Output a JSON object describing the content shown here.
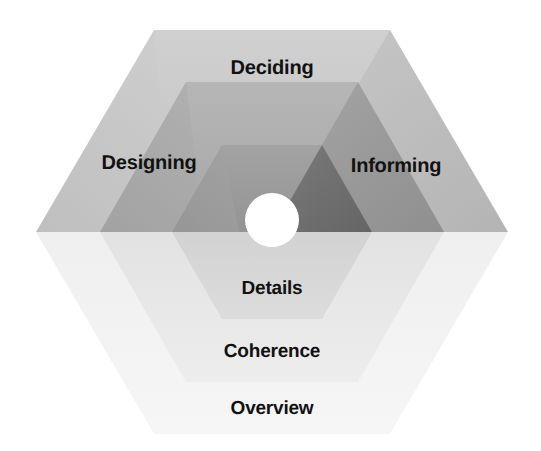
{
  "diagram": {
    "type": "nested-hexagon-rings",
    "geometry": {
      "center_x": 272,
      "center_y": 232,
      "rings": [
        {
          "name": "outer",
          "radius": 236,
          "half_height": 210
        },
        {
          "name": "middle",
          "radius": 172,
          "half_height": 150
        },
        {
          "name": "inner",
          "radius": 100,
          "half_height": 87
        }
      ],
      "hub_hole": {
        "center_x": 272,
        "center_y": 220,
        "radius": 27,
        "color": "#ffffff"
      }
    },
    "labels": {
      "deciding": "Deciding",
      "designing": "Designing",
      "informing": "Informing",
      "details": "Details",
      "coherence": "Coherence",
      "overview": "Overview"
    },
    "upper_facets": [
      {
        "ring": "outer",
        "label": "Deciding",
        "facets": {
          "left": "#c6c6c6",
          "top": "#c9c9c9",
          "right": "#bdbdbd"
        }
      },
      {
        "ring": "middle",
        "label": "Designing / Informing band",
        "facets": {
          "left": "#ababab",
          "top": "#aeaeae",
          "right": "#9a9a9a"
        }
      },
      {
        "ring": "inner",
        "label": "Inner core",
        "facets": {
          "left": "#9d9d9d",
          "top": "#9b9b9b",
          "right": "#6f6f6f"
        }
      }
    ],
    "lower_bands": [
      {
        "ring": "outer",
        "label": "Overview",
        "color": "#f2f2f2"
      },
      {
        "ring": "middle",
        "label": "Coherence",
        "color": "#e6e6e6"
      },
      {
        "ring": "inner",
        "label": "Details",
        "color": "#d6d6d6"
      }
    ],
    "palette": {
      "background": "#ffffff",
      "text": "#111111",
      "outer_upper_left": "#c6c6c6",
      "outer_upper_top": "#c9c9c9",
      "outer_upper_right": "#bdbdbd",
      "middle_upper_left": "#ababab",
      "middle_upper_top": "#aeaeae",
      "middle_upper_right": "#9a9a9a",
      "inner_upper_left": "#9d9d9d",
      "inner_upper_top": "#9b9b9b",
      "inner_upper_right": "#6f6f6f",
      "outer_lower": "#f2f2f2",
      "middle_lower": "#e6e6e6",
      "inner_lower": "#d6d6d6"
    }
  }
}
